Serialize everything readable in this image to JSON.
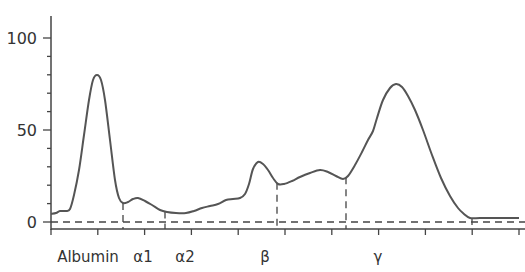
{
  "chart_data": {
    "type": "line",
    "title": "",
    "xlabel": "",
    "ylabel": "",
    "ylim": [
      0,
      100
    ],
    "yticks": [
      0,
      50,
      100
    ],
    "y_minor_step": 10,
    "grid": false,
    "legend": null,
    "categories": [
      "Albumin",
      "α1",
      "α2",
      "β",
      "γ"
    ],
    "category_label_x": [
      88,
      143,
      185,
      265,
      378
    ],
    "fraction_dividers_x_px": [
      123,
      165,
      277,
      346
    ],
    "baseline": 0,
    "series": [
      {
        "name": "Serum protein electrophoresis densitometry",
        "color": "#555555",
        "points_px": [
          [
            51,
            214
          ],
          [
            56,
            213
          ],
          [
            60,
            211
          ],
          [
            66,
            211
          ],
          [
            70,
            209
          ],
          [
            74,
            195
          ],
          [
            79,
            170
          ],
          [
            84,
            135
          ],
          [
            89,
            100
          ],
          [
            93,
            80
          ],
          [
            97,
            75
          ],
          [
            101,
            80
          ],
          [
            105,
            100
          ],
          [
            110,
            140
          ],
          [
            115,
            180
          ],
          [
            119,
            198
          ],
          [
            123,
            203
          ],
          [
            128,
            202
          ],
          [
            133,
            199
          ],
          [
            138,
            198
          ],
          [
            145,
            201
          ],
          [
            152,
            205
          ],
          [
            160,
            210
          ],
          [
            167,
            212
          ],
          [
            176,
            213
          ],
          [
            186,
            213
          ],
          [
            194,
            211
          ],
          [
            202,
            208
          ],
          [
            210,
            206
          ],
          [
            218,
            204
          ],
          [
            226,
            200
          ],
          [
            233,
            199
          ],
          [
            240,
            198
          ],
          [
            245,
            194
          ],
          [
            249,
            184
          ],
          [
            253,
            169
          ],
          [
            258,
            162
          ],
          [
            263,
            164
          ],
          [
            268,
            170
          ],
          [
            273,
            178
          ],
          [
            278,
            184
          ],
          [
            284,
            184
          ],
          [
            292,
            181
          ],
          [
            300,
            177
          ],
          [
            310,
            173
          ],
          [
            320,
            170
          ],
          [
            328,
            172
          ],
          [
            336,
            176
          ],
          [
            343,
            179
          ],
          [
            348,
            176
          ],
          [
            355,
            165
          ],
          [
            362,
            152
          ],
          [
            368,
            140
          ],
          [
            373,
            131
          ],
          [
            377,
            118
          ],
          [
            383,
            100
          ],
          [
            390,
            88
          ],
          [
            396,
            84
          ],
          [
            402,
            87
          ],
          [
            408,
            96
          ],
          [
            415,
            110
          ],
          [
            423,
            130
          ],
          [
            432,
            155
          ],
          [
            441,
            178
          ],
          [
            450,
            196
          ],
          [
            458,
            208
          ],
          [
            464,
            214
          ],
          [
            470,
            218
          ],
          [
            480,
            218
          ],
          [
            495,
            218
          ],
          [
            519,
            218
          ]
        ],
        "approx_values": {
          "albumin_peak": 80,
          "alpha1_peak": 13,
          "alpha2_level": 5,
          "beta_peak": 33,
          "beta2_bump": 28,
          "gamma_peak": 75,
          "tail": 2
        }
      }
    ]
  }
}
